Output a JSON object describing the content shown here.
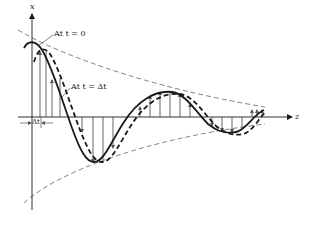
{
  "figure": {
    "axis_vertical_label": "x",
    "axis_horizontal_label": "z",
    "label_t0": "At t = 0",
    "label_tdt": "At t = Δt",
    "label_delta": "Δt"
  },
  "colors": {
    "ink": "#1a1a1a",
    "arrows": "#555555",
    "envelope": "#666666",
    "background": "#ffffff"
  }
}
